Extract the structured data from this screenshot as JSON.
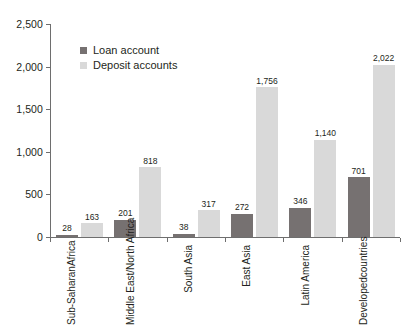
{
  "chart_data": {
    "type": "bar",
    "title": "",
    "subtitle": "",
    "xlabel": "",
    "ylabel": "",
    "ylim": [
      0,
      2500
    ],
    "ytick_labels": [
      "0",
      "500",
      "1,000",
      "1,500",
      "2,000",
      "2,500"
    ],
    "ytick_values": [
      0,
      500,
      1000,
      1500,
      2000,
      2500
    ],
    "grid": false,
    "legend_position": "top-left-inside",
    "categories": [
      "Sub-Saharan Africa",
      "Middle East/ North Africa",
      "South Asia",
      "East Asia",
      "Latin America",
      "Developed countries"
    ],
    "category_lines": [
      [
        "Sub-Saharan",
        "Africa"
      ],
      [
        "Middle East/",
        "North Africa"
      ],
      [
        "South Asia",
        ""
      ],
      [
        "East Asia",
        ""
      ],
      [
        "Latin America",
        ""
      ],
      [
        "Developed",
        "countries"
      ]
    ],
    "series": [
      {
        "name": "Loan account",
        "color": "#767171",
        "values": [
          28,
          201,
          38,
          272,
          346,
          701
        ],
        "value_labels": [
          "28",
          "201",
          "38",
          "272",
          "346",
          "701"
        ]
      },
      {
        "name": "Deposit accounts",
        "color": "#d9d9d9",
        "values": [
          163,
          818,
          317,
          1756,
          1140,
          2022
        ],
        "value_labels": [
          "163",
          "818",
          "317",
          "1,756",
          "1,140",
          "2,022"
        ]
      }
    ]
  },
  "legend": {
    "items": [
      {
        "label": "Loan account",
        "color": "#767171"
      },
      {
        "label": "Deposit accounts",
        "color": "#d9d9d9"
      }
    ]
  },
  "axis": {
    "line_color": "#6e6e6e"
  }
}
